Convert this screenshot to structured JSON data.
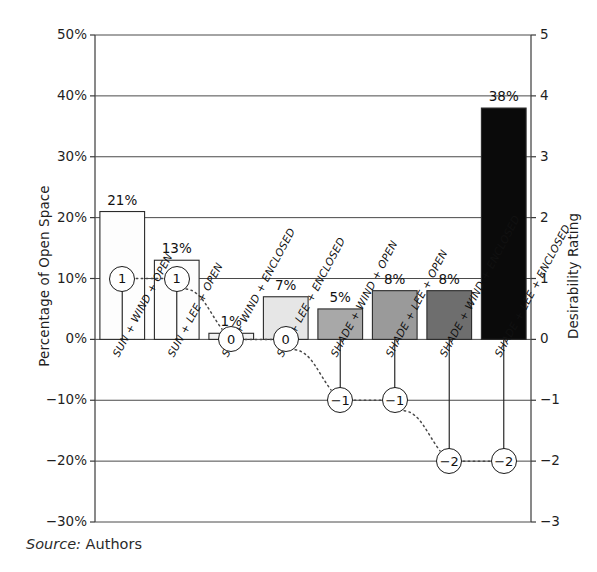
{
  "chart_data": {
    "type": "bar",
    "title": "",
    "categories": [
      "SUN + WIND + OPEN",
      "SUN + LEE + OPEN",
      "SUN + WIND + ENCLOSED",
      "SUN + LEE + ENCLOSED",
      "SHADE + WIND + OPEN",
      "SHADE + LEE + OPEN",
      "SHADE + WIND + ENCLOSED",
      "SHADE + LEE + ENCLOSED"
    ],
    "series": [
      {
        "name": "Percentage of Open Space",
        "axis": "left",
        "unit": "%",
        "values": [
          21,
          13,
          1,
          7,
          5,
          8,
          8,
          38
        ],
        "value_labels": [
          "21%",
          "13%",
          "1%",
          "7%",
          "5%",
          "8%",
          "8%",
          "38%"
        ],
        "bar_colors": [
          "#fdfdfd",
          "#fdfdfd",
          "#f2f2f2",
          "#e6e6e6",
          "#a8a8a8",
          "#9a9a9a",
          "#6e6e6e",
          "#0a0a0a"
        ]
      },
      {
        "name": "Desirability Rating",
        "axis": "right",
        "unit": "",
        "values": [
          1,
          1,
          0,
          0,
          -1,
          -1,
          -2,
          -2
        ],
        "value_labels": [
          "1",
          "1",
          "0",
          "0",
          "-1",
          "-1",
          "-2",
          "-2"
        ]
      }
    ],
    "xlabel": "",
    "ylabel": "Percentage of Open Space",
    "ylabel_right": "Desirability Rating",
    "ylim": [
      -30,
      50
    ],
    "ylim_right": [
      -3,
      5
    ],
    "yticks": [
      "50%",
      "40%",
      "30%",
      "20%",
      "10%",
      "0%",
      "-10%",
      "-20%",
      "-30%"
    ],
    "ytick_values": [
      50,
      40,
      30,
      20,
      10,
      0,
      -10,
      -20,
      -30
    ],
    "yticks_right": [
      "5",
      "4",
      "3",
      "2",
      "1",
      "0",
      "-1",
      "-2",
      "-3"
    ],
    "ytick_values_right": [
      5,
      4,
      3,
      2,
      1,
      0,
      -1,
      -2,
      -3
    ],
    "grid": true,
    "grid_axis": "y",
    "legend": "none"
  },
  "caption": {
    "source_word": "Source:",
    "source_value": " Authors"
  }
}
